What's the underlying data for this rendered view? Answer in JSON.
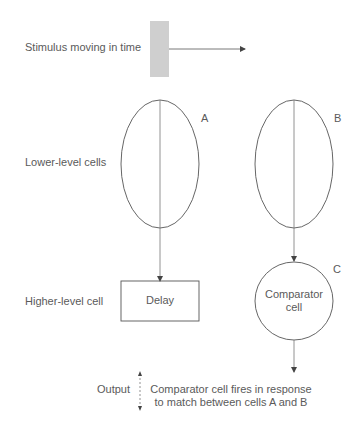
{
  "labels": {
    "stimulus": "Stimulus moving in time",
    "lower_level": "Lower-level cells",
    "higher_level": "Higher-level cell",
    "output": "Output"
  },
  "cells": {
    "a": {
      "letter": "A"
    },
    "b": {
      "letter": "B"
    },
    "c": {
      "letter": "C",
      "text_line1": "Comparator",
      "text_line2": "cell"
    },
    "delay": {
      "text": "Delay"
    }
  },
  "caption": {
    "line1": "Comparator cell fires in response",
    "line2": "to match between cells A and B"
  },
  "colors": {
    "stroke": "#555555",
    "stimulus_fill": "#cfcfcf",
    "text": "#5a5a5a"
  }
}
